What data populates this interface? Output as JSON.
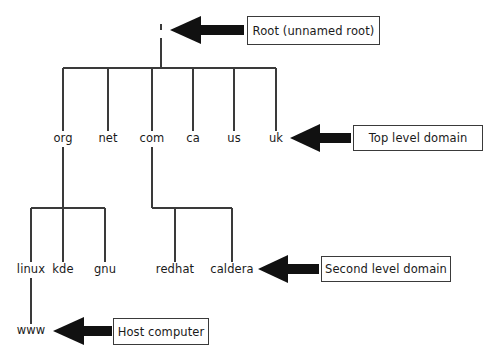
{
  "diagram": {
    "background_color": "#ffffff",
    "line_color": "#3a3a3a",
    "arrow_color": "#111111",
    "text_color": "#1a1a1a"
  },
  "root": {
    "label": ".",
    "marker": "dot"
  },
  "levels": {
    "top_level": {
      "nodes": [
        {
          "label": "org"
        },
        {
          "label": "net"
        },
        {
          "label": "com"
        },
        {
          "label": "ca"
        },
        {
          "label": "us"
        },
        {
          "label": "uk"
        }
      ]
    },
    "second_level": {
      "under_org": [
        {
          "label": "linux"
        },
        {
          "label": "kde"
        },
        {
          "label": "gnu"
        }
      ],
      "under_com": [
        {
          "label": "redhat"
        },
        {
          "label": "caldera"
        }
      ]
    },
    "host_level": {
      "nodes": [
        {
          "label": "www"
        }
      ]
    }
  },
  "callouts": [
    {
      "id": "root",
      "label": "Root (unnamed root)"
    },
    {
      "id": "tld",
      "label": "Top level domain"
    },
    {
      "id": "second",
      "label": "Second level domain"
    },
    {
      "id": "host",
      "label": "Host computer"
    }
  ]
}
